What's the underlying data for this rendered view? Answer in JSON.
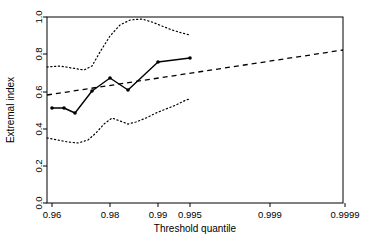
{
  "chart_data": {
    "type": "line",
    "title": "",
    "xlabel": "Threshold quantile",
    "ylabel": "Extremal index",
    "grid": false,
    "legend": "none",
    "xlim": [
      0.955,
      0.99995
    ],
    "ylim": [
      0.0,
      1.0
    ],
    "x_tick_labels": [
      "0.96",
      "0.98",
      "0.99",
      "0.995",
      "0.999",
      "0.9999"
    ],
    "x_tick_values": [
      0.96,
      0.98,
      0.99,
      0.995,
      0.999,
      0.9999
    ],
    "x_tick_positions": [
      52,
      110,
      158,
      190,
      270,
      345
    ],
    "y_tick_labels": [
      "0.0",
      "0.2",
      "0.4",
      "0.6",
      "0.8",
      "1.0"
    ],
    "y_tick_values": [
      0.0,
      0.2,
      0.4,
      0.6,
      0.8,
      1.0
    ],
    "y_tick_positions": [
      203,
      166,
      129,
      92,
      54,
      17
    ],
    "series": [
      {
        "name": "Extremal index estimate",
        "style": "solid-with-points",
        "x": [
          0.96,
          0.9665,
          0.972,
          0.98,
          0.9855,
          0.99,
          0.995
        ],
        "y": [
          0.485,
          0.483,
          0.455,
          0.575,
          0.672,
          0.612,
          0.78
        ],
        "x_px": [
          52,
          64,
          75,
          92,
          110,
          128,
          158
        ],
        "y_px": [
          108,
          108,
          113,
          91,
          78,
          90,
          62
        ],
        "end_x": 0.9965,
        "end_y": 0.8,
        "end_x_px": 190,
        "end_y_px": 58
      },
      {
        "name": "Upper confidence bound",
        "style": "dotted",
        "x_px": [
          47,
          60,
          72,
          84,
          92,
          100,
          110,
          120,
          130,
          142,
          152,
          162,
          172,
          182,
          190
        ],
        "y_px": [
          67,
          66,
          68,
          70,
          66,
          52,
          36,
          25,
          20,
          19,
          22,
          26,
          30,
          33,
          35
        ]
      },
      {
        "name": "Lower confidence bound",
        "style": "dotted",
        "x_px": [
          47,
          58,
          68,
          78,
          88,
          96,
          104,
          112,
          120,
          128,
          136,
          146,
          156,
          166,
          176,
          186,
          190
        ],
        "y_px": [
          138,
          140,
          142,
          143,
          140,
          133,
          124,
          118,
          121,
          124,
          122,
          118,
          113,
          109,
          105,
          100,
          99
        ]
      },
      {
        "name": "Fitted trend",
        "style": "dashed",
        "x_px": [
          47,
          343
        ],
        "y_px": [
          95,
          50
        ],
        "y_start": 0.58,
        "y_end": 0.83
      }
    ]
  },
  "plot_frame": {
    "left_px": 47,
    "right_px": 343,
    "top_px": 17,
    "bottom_px": 203
  },
  "colors": {
    "line": "#000000",
    "background": "#ffffff",
    "frame": "#000000"
  }
}
